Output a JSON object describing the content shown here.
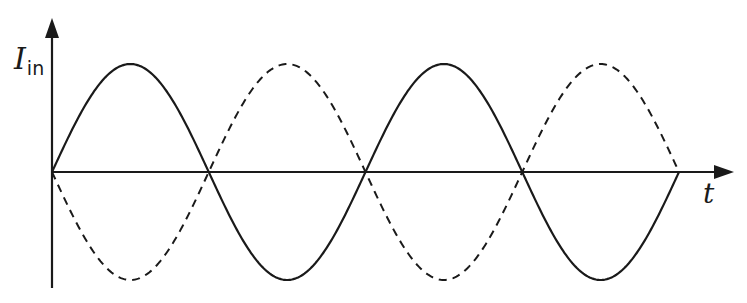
{
  "diagram": {
    "y_axis": {
      "label_main": "I",
      "label_sub": "in"
    },
    "x_axis": {
      "label": "t"
    },
    "colors": {
      "stroke": "#1a1a1a",
      "background": "#ffffff"
    },
    "series": [
      {
        "name": "solid-sine",
        "style": "solid",
        "phase": "starts rising",
        "half_periods": 4
      },
      {
        "name": "dashed-sine",
        "style": "dashed",
        "phase": "starts falling (inverted)",
        "half_periods": 4
      }
    ]
  },
  "chart_data": {
    "type": "line",
    "title": "",
    "xlabel": "t",
    "ylabel": "I_in",
    "grid": false,
    "x": [
      0,
      0.5,
      1,
      1.5,
      2,
      2.5,
      3,
      3.5,
      4
    ],
    "series": [
      {
        "name": "solid",
        "values": [
          0,
          1,
          0,
          -1,
          0,
          1,
          0,
          -1,
          0
        ]
      },
      {
        "name": "dashed",
        "values": [
          0,
          -1,
          0,
          1,
          0,
          -1,
          0,
          1,
          0
        ]
      }
    ],
    "ylim": [
      -1,
      1
    ]
  }
}
